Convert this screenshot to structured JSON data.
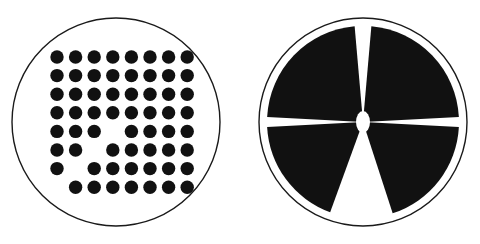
{
  "canvas": {
    "width": 480,
    "height": 244,
    "background": "#ffffff",
    "stroke_color": "#1a1a1a",
    "fill_color": "#111111"
  },
  "figures": [
    {
      "name": "dot-grid-disc",
      "label": "Left disc with dot matrix",
      "circle": {
        "cx": 116,
        "cy": 122,
        "r": 104,
        "stroke_width": 1.4,
        "fill": "none",
        "stroke": "#1a1a1a"
      },
      "grid": {
        "columns": 8,
        "rows": 8,
        "x_start": 57,
        "y_start": 57,
        "x_step": 18.6,
        "y_step": 18.6,
        "dot_radius": 6.7,
        "dot_fill": "#111111",
        "present": [
          [
            1,
            1,
            1,
            1,
            1,
            1,
            1,
            1
          ],
          [
            1,
            1,
            1,
            1,
            1,
            1,
            1,
            1
          ],
          [
            1,
            1,
            1,
            1,
            1,
            1,
            1,
            1
          ],
          [
            1,
            1,
            1,
            1,
            1,
            1,
            1,
            1
          ],
          [
            1,
            1,
            1,
            0,
            1,
            1,
            1,
            1
          ],
          [
            1,
            1,
            0,
            1,
            1,
            1,
            1,
            1
          ],
          [
            1,
            0,
            1,
            1,
            1,
            1,
            1,
            1
          ],
          [
            0,
            1,
            1,
            1,
            1,
            1,
            1,
            1
          ]
        ]
      }
    },
    {
      "name": "sector-disc",
      "label": "Right disc divided into four black sectors",
      "circle": {
        "cx": 363,
        "cy": 122,
        "r": 104,
        "stroke_width": 1.4,
        "fill": "none",
        "stroke": "#1a1a1a"
      },
      "disc": {
        "inner_radius": 96,
        "fill": "#111111"
      },
      "sectors": [
        {
          "name": "sector-top-left",
          "start_deg": 183,
          "end_deg": 265
        },
        {
          "name": "sector-top-right",
          "start_deg": 275,
          "end_deg": 357
        },
        {
          "name": "sector-bottom-right",
          "start_deg": 3,
          "end_deg": 72
        },
        {
          "name": "sector-bottom-left",
          "start_deg": 110,
          "end_deg": 177
        }
      ],
      "hub": {
        "name": "center-hub",
        "cx": 363,
        "cy": 122,
        "rx": 7,
        "ry": 11,
        "fill": "#ffffff"
      }
    }
  ]
}
